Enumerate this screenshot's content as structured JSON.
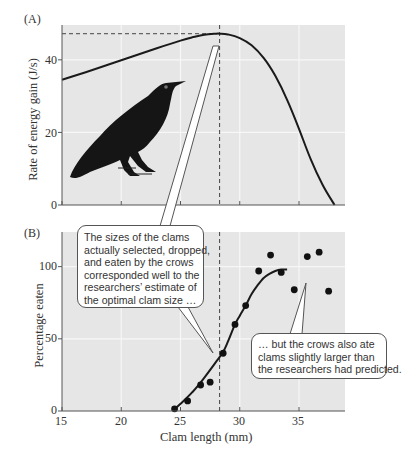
{
  "figure": {
    "panel_a_label": "(A)",
    "panel_b_label": "(B)",
    "colors": {
      "plot_bg": "#e6e6e6",
      "grid": "#f7f7f7",
      "curve": "#1a1a1a",
      "axis": "#555555",
      "text": "#333333",
      "callout_border": "#555555",
      "callout_bg": "#ffffff"
    },
    "callout_1": {
      "lines": [
        "The sizes of the clams",
        "actually selected, dropped,",
        "and eaten by the crows",
        "corresponded well to the",
        "researchers’ estimate of",
        "the optimal clam size …"
      ]
    },
    "callout_2": {
      "lines": [
        "… but the crows also ate",
        "clams slightly larger than",
        "the researchers had predicted."
      ]
    },
    "illustration": "crow-silhouette"
  },
  "chart_data": [
    {
      "panel": "A",
      "type": "line",
      "title": "",
      "xlabel": "",
      "ylabel": "Rate of energy gain (J/s)",
      "xlim": [
        15,
        39
      ],
      "ylim": [
        0,
        50
      ],
      "xticks": [
        15,
        20,
        25,
        30,
        35
      ],
      "yticks": [
        0,
        20,
        40
      ],
      "ytick_labels": [
        "0",
        "20",
        "40"
      ],
      "grid": true,
      "series": [
        {
          "name": "Predicted rate of energy gain",
          "x": [
            15,
            17,
            19,
            21,
            23,
            25,
            26,
            27,
            28,
            28.3,
            29,
            30,
            31,
            32,
            33,
            34,
            35,
            36,
            37,
            38
          ],
          "y": [
            34.5,
            36.6,
            38.8,
            41,
            43.2,
            45.3,
            46.2,
            46.9,
            47.2,
            47.2,
            47.0,
            46.0,
            44.0,
            40.6,
            35.6,
            29.0,
            21.0,
            12.5,
            5.5,
            0
          ]
        }
      ],
      "annotations": [
        {
          "type": "hline-dashed",
          "y": 47.2,
          "x_from": 15,
          "x_to": 28.3,
          "label": "maximum rate"
        },
        {
          "type": "vline-dashed",
          "x": 28.3,
          "label": "optimal clam size"
        }
      ]
    },
    {
      "panel": "B",
      "type": "scatter",
      "title": "",
      "xlabel": "Clam length (mm)",
      "ylabel": "Percentage eaten",
      "xlim": [
        15,
        39
      ],
      "ylim": [
        0,
        124
      ],
      "xticks": [
        15,
        20,
        25,
        30,
        35
      ],
      "xtick_labels": [
        "15",
        "20",
        "25",
        "30",
        "35"
      ],
      "yticks": [
        0,
        50,
        100
      ],
      "ytick_labels": [
        "0",
        "50",
        "100"
      ],
      "grid": true,
      "series": [
        {
          "name": "Observed clams eaten",
          "x": [
            24.5,
            25.6,
            26.7,
            27.5,
            28.6,
            29.6,
            30.5,
            31.6,
            32.6,
            33.5,
            34.6,
            35.7,
            36.7,
            37.5
          ],
          "y": [
            1.5,
            7,
            18,
            20,
            40,
            60,
            73,
            97,
            108,
            96,
            84,
            107,
            110,
            83
          ]
        },
        {
          "name": "Fitted curve",
          "type": "line",
          "x": [
            24.4,
            25,
            26,
            27,
            28,
            28.6,
            29,
            29.6,
            30,
            30.5,
            31,
            31.5,
            32,
            32.5,
            33,
            33.5,
            34
          ],
          "y": [
            0.5,
            5,
            13,
            23,
            34,
            41,
            48,
            60,
            66,
            73,
            81,
            87,
            92,
            95,
            97,
            98,
            98
          ]
        }
      ],
      "annotations": [
        {
          "type": "vline-dashed",
          "x": 28.3,
          "label": "predicted optimal clam size"
        }
      ]
    }
  ]
}
